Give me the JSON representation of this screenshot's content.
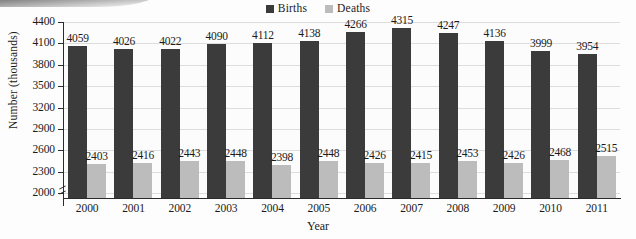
{
  "chart_data": {
    "type": "bar",
    "title": "",
    "xlabel": "Year",
    "ylabel": "Number (thousands)",
    "categories": [
      "2000",
      "2001",
      "2002",
      "2003",
      "2004",
      "2005",
      "2006",
      "2007",
      "2008",
      "2009",
      "2010",
      "2011"
    ],
    "series": [
      {
        "name": "Births",
        "color": "#3b3b3b",
        "values": [
          4059,
          4026,
          4022,
          4090,
          4112,
          4138,
          4266,
          4315,
          4247,
          4136,
          3999,
          3954
        ]
      },
      {
        "name": "Deaths",
        "color": "#bcbcbc",
        "values": [
          2403,
          2416,
          2443,
          2448,
          2398,
          2448,
          2426,
          2415,
          2453,
          2426,
          2468,
          2515
        ]
      }
    ],
    "ylim": [
      1930,
      4400
    ],
    "yticks": [
      2000,
      2300,
      2600,
      2900,
      3200,
      3500,
      3800,
      4100,
      4400
    ],
    "ytick_labels": [
      "2000",
      "2300",
      "2600",
      "2900",
      "3200",
      "3500",
      "3800",
      "4100",
      "4400"
    ],
    "grid": true,
    "grid_axis": "y",
    "legend_position": "top-center",
    "axis_break": true
  },
  "legend": {
    "entries": [
      {
        "label": "Births",
        "color": "#3b3b3b"
      },
      {
        "label": "Deaths",
        "color": "#bcbcbc"
      }
    ]
  }
}
